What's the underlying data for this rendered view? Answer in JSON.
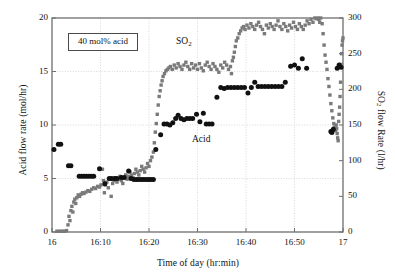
{
  "figure": {
    "background_color": "#ffffff",
    "annotation_label": "40 mol% acid"
  },
  "axes": {
    "left": {
      "title": "Acid flow rate (mol/hr)",
      "ticks": [
        "0",
        "5",
        "10",
        "15",
        "20"
      ],
      "values": [
        0,
        5,
        10,
        15,
        20
      ],
      "min": 0,
      "max": 20
    },
    "right": {
      "title": "SO2 flow Rate (l/hr)",
      "title_pre": "SO",
      "title_sub": "2",
      "title_post": " flow Rate (l/hr)",
      "ticks": [
        "0",
        "50",
        "100",
        "150",
        "200",
        "250",
        "300"
      ],
      "values": [
        0,
        50,
        100,
        150,
        200,
        250,
        300
      ],
      "min": 0,
      "max": 300
    },
    "bottom": {
      "title": "Time of day (hr:min)",
      "ticks": [
        "16",
        "16:10",
        "16:20",
        "16:30",
        "16:40",
        "16:50",
        "17"
      ],
      "values": [
        0,
        10,
        20,
        30,
        40,
        50,
        60
      ],
      "min": 0,
      "max": 60
    }
  },
  "series_labels": {
    "so2": "SO2",
    "so2_pre": "SO",
    "so2_sub": "2",
    "acid": "Acid"
  },
  "colors": {
    "so2_marker": "#7a7a7a",
    "acid_marker": "#111111",
    "axis": "#6e6e6e",
    "grid": "#c8c8c8",
    "text": "#111111",
    "background": "#ffffff"
  },
  "chart_data": {
    "type": "scatter",
    "title": "",
    "xlabel": "Time of day (hr:min)",
    "ylabel": "Acid flow rate (mol/hr)",
    "ylabel_secondary": "SO2 flow Rate (l/hr)",
    "xlim": [
      0,
      60
    ],
    "ylim": [
      0,
      20
    ],
    "ylim_secondary": [
      0,
      300
    ],
    "grid": true,
    "grid_style": "dotted",
    "legend": "inline-annotations",
    "annotations": [
      {
        "text": "40 mol% acid",
        "x": 4.5,
        "y": 18.0,
        "boxed": true
      },
      {
        "text": "SO2",
        "x": 25.5,
        "y": 18.2,
        "boxed": false
      },
      {
        "text": "Acid",
        "x": 29.5,
        "y": 8.6,
        "boxed": false
      }
    ],
    "x_note": "x in minutes after 16:00",
    "series": [
      {
        "name": "SO2 flow rate",
        "axis": "right",
        "units": "l/hr",
        "marker": "square",
        "color": "#7a7a7a",
        "points": [
          [
            1.0,
            1
          ],
          [
            1.4,
            1
          ],
          [
            1.8,
            1
          ],
          [
            2.2,
            1
          ],
          [
            2.6,
            1
          ],
          [
            3.0,
            2
          ],
          [
            3.3,
            10
          ],
          [
            3.5,
            22
          ],
          [
            3.7,
            16
          ],
          [
            3.9,
            30
          ],
          [
            4.1,
            36
          ],
          [
            4.3,
            28
          ],
          [
            4.5,
            42
          ],
          [
            4.7,
            46
          ],
          [
            4.9,
            40
          ],
          [
            5.1,
            48
          ],
          [
            5.4,
            52
          ],
          [
            5.7,
            50
          ],
          [
            6.0,
            53
          ],
          [
            6.3,
            55
          ],
          [
            6.6,
            54
          ],
          [
            7.0,
            56
          ],
          [
            7.4,
            58
          ],
          [
            7.8,
            57
          ],
          [
            8.2,
            60
          ],
          [
            8.6,
            62
          ],
          [
            9.0,
            61
          ],
          [
            9.4,
            64
          ],
          [
            9.8,
            63
          ],
          [
            10.1,
            66
          ],
          [
            10.4,
            88
          ],
          [
            10.6,
            72
          ],
          [
            10.8,
            55
          ],
          [
            11.0,
            66
          ],
          [
            11.3,
            70
          ],
          [
            11.6,
            62
          ],
          [
            11.9,
            74
          ],
          [
            12.2,
            50
          ],
          [
            12.5,
            68
          ],
          [
            12.8,
            72
          ],
          [
            13.1,
            76
          ],
          [
            13.4,
            70
          ],
          [
            13.7,
            74
          ],
          [
            14.0,
            78
          ],
          [
            14.3,
            72
          ],
          [
            14.6,
            68
          ],
          [
            14.9,
            76
          ],
          [
            15.2,
            80
          ],
          [
            15.5,
            74
          ],
          [
            15.8,
            78
          ],
          [
            16.1,
            84
          ],
          [
            16.4,
            80
          ],
          [
            16.7,
            76
          ],
          [
            17.0,
            82
          ],
          [
            17.3,
            88
          ],
          [
            17.6,
            84
          ],
          [
            17.9,
            80
          ],
          [
            18.2,
            86
          ],
          [
            18.5,
            92
          ],
          [
            18.8,
            88
          ],
          [
            19.1,
            84
          ],
          [
            19.4,
            90
          ],
          [
            19.7,
            96
          ],
          [
            20.0,
            92
          ],
          [
            20.3,
            100
          ],
          [
            20.6,
            105
          ],
          [
            20.9,
            112
          ],
          [
            21.1,
            125
          ],
          [
            21.3,
            140
          ],
          [
            21.5,
            152
          ],
          [
            21.7,
            165
          ],
          [
            21.9,
            178
          ],
          [
            22.1,
            190
          ],
          [
            22.3,
            198
          ],
          [
            22.5,
            206
          ],
          [
            22.7,
            212
          ],
          [
            22.9,
            218
          ],
          [
            23.2,
            222
          ],
          [
            23.5,
            226
          ],
          [
            23.8,
            228
          ],
          [
            24.1,
            230
          ],
          [
            24.4,
            232
          ],
          [
            24.8,
            228
          ],
          [
            25.2,
            234
          ],
          [
            25.6,
            230
          ],
          [
            26.0,
            236
          ],
          [
            26.4,
            232
          ],
          [
            26.8,
            228
          ],
          [
            27.2,
            234
          ],
          [
            27.6,
            238
          ],
          [
            28.0,
            232
          ],
          [
            28.4,
            228
          ],
          [
            28.8,
            236
          ],
          [
            29.2,
            230
          ],
          [
            29.6,
            234
          ],
          [
            30.0,
            228
          ],
          [
            30.4,
            236
          ],
          [
            30.8,
            230
          ],
          [
            31.2,
            226
          ],
          [
            31.6,
            234
          ],
          [
            32.0,
            238
          ],
          [
            32.4,
            232
          ],
          [
            32.8,
            228
          ],
          [
            33.2,
            236
          ],
          [
            33.6,
            232
          ],
          [
            34.0,
            228
          ],
          [
            34.4,
            224
          ],
          [
            34.8,
            234
          ],
          [
            35.2,
            230
          ],
          [
            35.6,
            238
          ],
          [
            36.0,
            234
          ],
          [
            36.4,
            228
          ],
          [
            36.8,
            232
          ],
          [
            37.0,
            222
          ],
          [
            37.2,
            240
          ],
          [
            37.4,
            245
          ],
          [
            37.6,
            252
          ],
          [
            37.8,
            260
          ],
          [
            38.0,
            268
          ],
          [
            38.3,
            272
          ],
          [
            38.6,
            278
          ],
          [
            38.9,
            282
          ],
          [
            39.2,
            286
          ],
          [
            39.5,
            288
          ],
          [
            39.8,
            284
          ],
          [
            40.2,
            290
          ],
          [
            40.6,
            286
          ],
          [
            41.0,
            292
          ],
          [
            41.4,
            288
          ],
          [
            41.8,
            284
          ],
          [
            42.2,
            290
          ],
          [
            42.6,
            294
          ],
          [
            43.0,
            288
          ],
          [
            43.4,
            284
          ],
          [
            43.8,
            278
          ],
          [
            44.2,
            290
          ],
          [
            44.6,
            286
          ],
          [
            45.0,
            292
          ],
          [
            45.4,
            288
          ],
          [
            45.8,
            284
          ],
          [
            46.2,
            290
          ],
          [
            46.6,
            296
          ],
          [
            47.0,
            288
          ],
          [
            47.4,
            284
          ],
          [
            47.8,
            292
          ],
          [
            48.2,
            288
          ],
          [
            48.6,
            282
          ],
          [
            49.0,
            290
          ],
          [
            49.4,
            286
          ],
          [
            49.8,
            294
          ],
          [
            50.2,
            288
          ],
          [
            50.6,
            284
          ],
          [
            51.0,
            292
          ],
          [
            51.4,
            288
          ],
          [
            51.8,
            284
          ],
          [
            52.2,
            290
          ],
          [
            52.6,
            296
          ],
          [
            53.0,
            292
          ],
          [
            53.4,
            298
          ],
          [
            53.8,
            294
          ],
          [
            54.2,
            300
          ],
          [
            54.5,
            299
          ],
          [
            54.8,
            300
          ],
          [
            55.0,
            298
          ],
          [
            55.2,
            294
          ],
          [
            55.4,
            300
          ],
          [
            55.7,
            292
          ],
          [
            55.9,
            278
          ],
          [
            56.1,
            262
          ],
          [
            56.3,
            248
          ],
          [
            56.5,
            238
          ],
          [
            56.7,
            228
          ],
          [
            56.9,
            215
          ],
          [
            57.1,
            204
          ],
          [
            57.3,
            192
          ],
          [
            57.5,
            180
          ],
          [
            57.7,
            170
          ],
          [
            57.9,
            160
          ],
          [
            58.1,
            152
          ],
          [
            58.2,
            146
          ],
          [
            58.3,
            143
          ],
          [
            58.4,
            148
          ],
          [
            58.5,
            142
          ],
          [
            58.6,
            150
          ],
          [
            58.7,
            145
          ],
          [
            58.8,
            138
          ],
          [
            58.9,
            132
          ],
          [
            59.0,
            128
          ],
          [
            59.1,
            155
          ],
          [
            59.2,
            165
          ],
          [
            59.3,
            175
          ],
          [
            59.4,
            190
          ],
          [
            59.5,
            210
          ],
          [
            59.6,
            235
          ],
          [
            59.7,
            250
          ],
          [
            59.8,
            262
          ],
          [
            59.9,
            268
          ],
          [
            60.0,
            272
          ]
        ]
      },
      {
        "name": "Acid flow rate",
        "axis": "left",
        "units": "mol/hr",
        "marker": "circle",
        "color": "#111111",
        "points": [
          [
            0.4,
            7.7
          ],
          [
            1.3,
            8.2
          ],
          [
            1.8,
            8.2
          ],
          [
            3.4,
            6.2
          ],
          [
            3.9,
            6.2
          ],
          [
            5.6,
            5.2
          ],
          [
            6.1,
            5.2
          ],
          [
            6.6,
            5.2
          ],
          [
            7.1,
            5.2
          ],
          [
            7.6,
            5.2
          ],
          [
            8.1,
            5.2
          ],
          [
            8.6,
            5.2
          ],
          [
            9.8,
            5.9
          ],
          [
            10.9,
            4.5
          ],
          [
            11.8,
            5.0
          ],
          [
            12.3,
            5.0
          ],
          [
            12.9,
            5.0
          ],
          [
            13.4,
            5.0
          ],
          [
            14.3,
            5.1
          ],
          [
            14.9,
            5.1
          ],
          [
            15.8,
            5.7
          ],
          [
            16.3,
            5.0
          ],
          [
            16.9,
            4.9
          ],
          [
            17.4,
            4.9
          ],
          [
            17.9,
            4.9
          ],
          [
            18.4,
            4.9
          ],
          [
            18.9,
            4.9
          ],
          [
            19.4,
            4.9
          ],
          [
            19.9,
            4.9
          ],
          [
            20.4,
            4.9
          ],
          [
            20.9,
            4.9
          ],
          [
            21.4,
            7.7
          ],
          [
            22.4,
            9.1
          ],
          [
            23.1,
            10.1
          ],
          [
            23.7,
            10.1
          ],
          [
            24.3,
            10.0
          ],
          [
            24.9,
            10.2
          ],
          [
            25.5,
            10.6
          ],
          [
            26.0,
            10.9
          ],
          [
            26.6,
            10.6
          ],
          [
            27.2,
            10.5
          ],
          [
            27.8,
            10.6
          ],
          [
            28.4,
            10.6
          ],
          [
            29.0,
            10.6
          ],
          [
            29.8,
            11.0
          ],
          [
            30.5,
            10.3
          ],
          [
            31.2,
            11.1
          ],
          [
            31.8,
            10.1
          ],
          [
            32.4,
            10.1
          ],
          [
            33.0,
            10.1
          ],
          [
            34.0,
            12.6
          ],
          [
            34.8,
            13.5
          ],
          [
            35.5,
            13.4
          ],
          [
            36.2,
            13.5
          ],
          [
            36.9,
            13.5
          ],
          [
            37.6,
            13.5
          ],
          [
            38.3,
            13.5
          ],
          [
            39.0,
            13.5
          ],
          [
            39.7,
            13.5
          ],
          [
            40.4,
            13.0
          ],
          [
            41.1,
            13.5
          ],
          [
            41.8,
            14.0
          ],
          [
            42.5,
            13.6
          ],
          [
            43.2,
            13.6
          ],
          [
            43.9,
            13.6
          ],
          [
            44.6,
            13.6
          ],
          [
            45.3,
            13.6
          ],
          [
            46.0,
            13.6
          ],
          [
            46.7,
            13.6
          ],
          [
            47.4,
            13.6
          ],
          [
            48.1,
            14.0
          ],
          [
            49.2,
            15.5
          ],
          [
            50.0,
            15.6
          ],
          [
            50.8,
            15.3
          ],
          [
            51.6,
            16.2
          ],
          [
            52.5,
            15.3
          ],
          [
            57.5,
            9.4
          ],
          [
            57.7,
            9.3
          ],
          [
            58.0,
            9.6
          ],
          [
            58.8,
            15.3
          ],
          [
            59.2,
            15.6
          ],
          [
            59.6,
            15.4
          ]
        ]
      }
    ]
  }
}
